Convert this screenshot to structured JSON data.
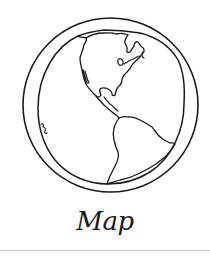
{
  "card": {
    "label": "Map",
    "icon": "globe-americas-icon"
  },
  "colors": {
    "background": "#ffffff",
    "stroke": "#1a1a1a",
    "divider": "#c8c8c8"
  }
}
